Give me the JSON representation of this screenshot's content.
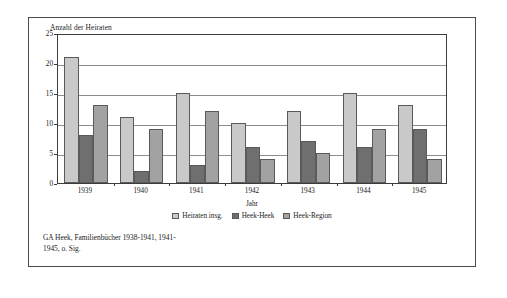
{
  "figure": {
    "caption_line1": "GA Heek, Familienbücher 1938-1941, 1941-",
    "caption_line2": "1945, o. Sig."
  },
  "chart_data": {
    "type": "bar",
    "title": "",
    "ylabel": "Anzahl der Heiraten",
    "xlabel": "Jahr",
    "categories": [
      "1939",
      "1940",
      "1941",
      "1942",
      "1943",
      "1944",
      "1945"
    ],
    "series": [
      {
        "name": "Heiraten insg.",
        "color": "#c9c9c9",
        "values": [
          21,
          11,
          15,
          10,
          12,
          15,
          13
        ]
      },
      {
        "name": "Heek-Heek",
        "color": "#6f6f6f",
        "values": [
          8,
          2,
          3,
          6,
          7,
          6,
          9
        ]
      },
      {
        "name": "Heek-Region",
        "color": "#a2a2a2",
        "values": [
          13,
          9,
          12,
          4,
          5,
          9,
          4
        ]
      }
    ],
    "ylim": [
      0,
      25
    ],
    "yticks": [
      0,
      5,
      10,
      15,
      20,
      25
    ],
    "ytick_labels": [
      "0",
      "5",
      "10",
      "15",
      "20",
      "25"
    ],
    "grid": true,
    "legend_position": "bottom"
  }
}
